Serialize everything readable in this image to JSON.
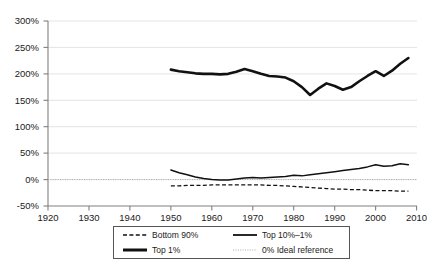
{
  "chart_data": {
    "type": "line",
    "title": "",
    "subtitle": "",
    "xlabel": "",
    "ylabel": "",
    "xlim": [
      1920,
      2010
    ],
    "ylim": [
      -50,
      300
    ],
    "grid": true,
    "legend_position": "bottom",
    "x_ticks": [
      "1920",
      "1930",
      "1940",
      "1950",
      "1960",
      "1970",
      "1980",
      "1990",
      "2000",
      "2010"
    ],
    "y_ticks": [
      "-50%",
      "0%",
      "50%",
      "100%",
      "150%",
      "200%",
      "250%",
      "300%"
    ],
    "x": [
      1950,
      1952,
      1954,
      1956,
      1958,
      1960,
      1962,
      1964,
      1966,
      1968,
      1970,
      1972,
      1974,
      1976,
      1978,
      1980,
      1982,
      1984,
      1986,
      1988,
      1990,
      1992,
      1994,
      1996,
      1998,
      2000,
      2002,
      2004,
      2006,
      2008
    ],
    "series": [
      {
        "name": "Top 1%",
        "style": "thick-solid",
        "values": [
          208,
          205,
          203,
          201,
          200,
          200,
          199,
          200,
          204,
          209,
          205,
          200,
          196,
          195,
          193,
          186,
          175,
          160,
          172,
          182,
          177,
          170,
          175,
          186,
          196,
          205,
          196,
          206,
          219,
          230
        ]
      },
      {
        "name": "Top 10%–1%",
        "style": "medium-solid",
        "values": [
          18,
          13,
          9,
          5,
          2,
          0,
          -1,
          -1,
          1,
          3,
          4,
          3,
          4,
          5,
          6,
          8,
          7,
          9,
          11,
          13,
          15,
          17,
          19,
          21,
          24,
          28,
          25,
          26,
          30,
          28
        ]
      },
      {
        "name": "Bottom 90%",
        "style": "dashed",
        "values": [
          -12,
          -12,
          -11,
          -11,
          -11,
          -10,
          -10,
          -10,
          -10,
          -10,
          -10,
          -10,
          -11,
          -11,
          -12,
          -13,
          -14,
          -15,
          -16,
          -17,
          -18,
          -18,
          -19,
          -19,
          -20,
          -21,
          -21,
          -21,
          -22,
          -22
        ]
      },
      {
        "name": "0% Ideal reference",
        "style": "dotted",
        "values": [
          0,
          0,
          0,
          0,
          0,
          0,
          0,
          0,
          0,
          0,
          0,
          0,
          0,
          0,
          0,
          0,
          0,
          0,
          0,
          0,
          0,
          0,
          0,
          0,
          0,
          0,
          0,
          0,
          0,
          0
        ]
      }
    ]
  },
  "legend": {
    "entries": [
      {
        "label": "Bottom 90%",
        "swatch": "dashed-line-swatch"
      },
      {
        "label": "Top 10%–1%",
        "swatch": "medium-solid-line-swatch"
      },
      {
        "label": "Top 1%",
        "swatch": "thick-solid-line-swatch"
      },
      {
        "label": "0% Ideal reference",
        "swatch": "dotted-line-swatch"
      }
    ]
  },
  "caption": {
    "text": ""
  },
  "colors": {
    "line": "#111111",
    "gridline": "#d9d9d9",
    "axis": "#808080",
    "reference": "#aaaaaa",
    "background": "#ffffff"
  }
}
